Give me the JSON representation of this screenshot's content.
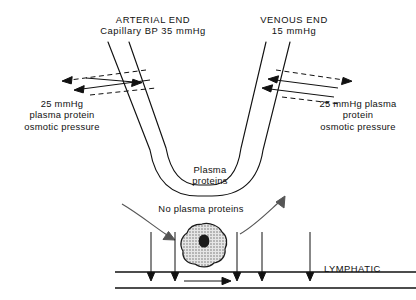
{
  "figure": {
    "line_color": "#111111",
    "cell_fill": "#d8d8d8",
    "nucleus_color": "#1a1a1a"
  },
  "arterial": {
    "end_label": "ARTERIAL END",
    "pressure_label": "Capillary BP 35 mmHg",
    "osmotic_label": "25 mmHg\nplasma protein\nosmotic pressure"
  },
  "venous": {
    "end_label": "VENOUS END",
    "pressure_label": "15 mmHg",
    "osmotic_label": "25 mmHg plasma\nprotein\nosmotic pressure"
  },
  "capillary": {
    "plasma_label": "Plasma\nproteins"
  },
  "tissue": {
    "no_plasma_label": "No plasma proteins"
  },
  "lymphatic": {
    "label": "LYMPHATIC"
  }
}
